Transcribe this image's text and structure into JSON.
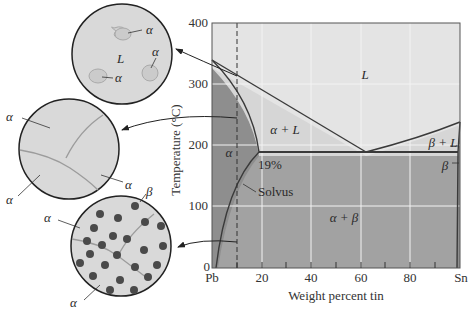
{
  "diagram": {
    "x_axis": {
      "label": "Weight percent tin",
      "ticks": [
        "Pb",
        "20",
        "40",
        "60",
        "80",
        "Sn"
      ]
    },
    "y_axis": {
      "label": "Temperature (°C)",
      "ticks": [
        "0",
        "100",
        "200",
        "300",
        "400"
      ]
    },
    "regions": {
      "liquid": "L",
      "alpha_liquid": "α + L",
      "beta_liquid": "β + L",
      "alpha": "α",
      "beta": "β",
      "alpha_beta": "α + β"
    },
    "annotations": {
      "solubility_limit": "19%",
      "solvus": "Solvus"
    },
    "microstructures": [
      {
        "name": "liquid-with-alpha",
        "labels": {
          "matrix": "L",
          "grain_1": "α",
          "grain_2": "α",
          "grain_3": "α"
        }
      },
      {
        "name": "alpha-grains",
        "labels": {
          "grain_1": "α",
          "grain_2": "α",
          "grain_3": "α"
        }
      },
      {
        "name": "alpha-with-beta-precipitates",
        "labels": {
          "precipitate": "β",
          "matrix_1": "α",
          "matrix_2": "α"
        }
      }
    ],
    "colors": {
      "liquid_fill": "#e4e4e4",
      "two_phase_light": "#d4d4d4",
      "solid_dark": "#8f8f8f",
      "alpha_beta_fill": "#a0a0a0",
      "line": "#3a3a3a",
      "gridline": "#f4f4f4",
      "circle_fill": "#d9d9d9",
      "precipitate": "#4a4a4a"
    }
  }
}
